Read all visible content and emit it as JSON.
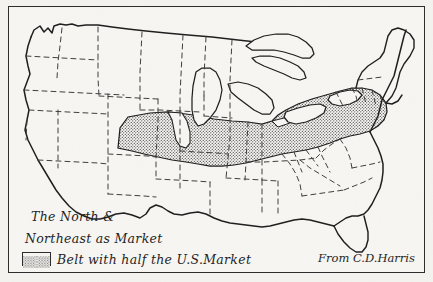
{
  "figure": {
    "kind": "map",
    "background_color": "#f4f3f0",
    "ink_color": "#1d1d1d",
    "frame_color": "#2b2b2b"
  },
  "legend": {
    "line_1": "The North &",
    "line_2": "Northeast as Market",
    "line_3": "Belt with half the U.S.Market",
    "swatch_name": "stipple-pattern-swatch",
    "swatch_fill": "stipple"
  },
  "attribution": {
    "text": "From C.D.Harris"
  },
  "map_features": {
    "national_outline_style": "solid",
    "state_boundary_style": "dashed",
    "great_lakes_style": "solid",
    "shaded_region_label": "Manufacturing / market belt",
    "shaded_region_fill": "stipple",
    "shaded_region_extent": "Great Lakes states through the Middle Atlantic to the Atlantic coast"
  }
}
